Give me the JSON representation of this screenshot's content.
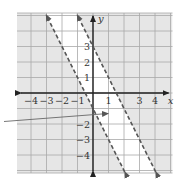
{
  "chart_data": {
    "type": "line",
    "title": "",
    "xlabel": "x",
    "ylabel": "y",
    "xlim": [
      -5,
      5
    ],
    "ylim": [
      -5,
      5
    ],
    "grid": true,
    "x_tick_labels": [
      "-4",
      "-3",
      "-2",
      "-1",
      "1",
      "3",
      "4"
    ],
    "y_tick_labels": [
      "3",
      "2",
      "1",
      "-2",
      "-3",
      "-4"
    ],
    "series": [
      {
        "name": "boundary-left",
        "equation": "y = -2x - 1",
        "style": "dashed",
        "slope": -2,
        "intercept": -1
      },
      {
        "name": "boundary-right",
        "equation": "y = -2x + 3",
        "style": "dashed",
        "slope": -2,
        "intercept": 3
      }
    ],
    "shaded_regions": [
      {
        "description": "below/left of y = -2x - 1",
        "inequality": "y < -2x - 1"
      },
      {
        "description": "above/right of y = -2x + 3",
        "inequality": "y > -2x + 3"
      }
    ],
    "unshaded_region": "band between the two dashed lines",
    "annotation": "pointer arrow from left edge toward the unshaded band near (1, -1.4)"
  },
  "labels": {
    "x_axis": "x",
    "y_axis": "y",
    "xticks": [
      {
        "v": -4,
        "t": "−4"
      },
      {
        "v": -3,
        "t": "−3"
      },
      {
        "v": -2,
        "t": "−2"
      },
      {
        "v": -1,
        "t": "−1"
      },
      {
        "v": 1,
        "t": "1"
      },
      {
        "v": 3,
        "t": "3"
      },
      {
        "v": 4,
        "t": "4"
      }
    ],
    "yticks": [
      {
        "v": 3,
        "t": "3"
      },
      {
        "v": 2,
        "t": "2"
      },
      {
        "v": 1,
        "t": "1"
      },
      {
        "v": -2,
        "t": "−2"
      },
      {
        "v": -3,
        "t": "−3"
      },
      {
        "v": -4,
        "t": "−4"
      }
    ]
  },
  "colors": {
    "background": "#ffffff",
    "shade": "#e6e6e6",
    "grid": "#a8a8a8",
    "axis": "#222222",
    "line": "#555555"
  }
}
